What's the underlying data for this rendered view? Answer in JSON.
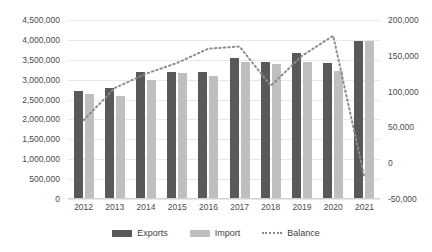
{
  "chart_data": {
    "type": "bar",
    "title": "",
    "subtitle": "",
    "xlabel": "",
    "ylabel": "",
    "y2label": "",
    "grid": true,
    "legend_position": "bottom",
    "categories": [
      "2012",
      "2013",
      "2014",
      "2015",
      "2016",
      "2017",
      "2018",
      "2019",
      "2020",
      "2021"
    ],
    "ylim": [
      0,
      4500000
    ],
    "y2lim": [
      -50000,
      200000
    ],
    "yticks": [
      "0",
      "500,000",
      "1,000,000",
      "1,500,000",
      "2,000,000",
      "2,500,000",
      "3,000,000",
      "3,500,000",
      "4,000,000",
      "4,500,000"
    ],
    "ytick_values": [
      0,
      500000,
      1000000,
      1500000,
      2000000,
      2500000,
      3000000,
      3500000,
      4000000,
      4500000
    ],
    "y2ticks": [
      "-50,000",
      "0",
      "50,000",
      "100,000",
      "150,000",
      "200,000"
    ],
    "y2tick_values": [
      -50000,
      0,
      50000,
      100000,
      150000,
      200000
    ],
    "series": [
      {
        "name": "Exports",
        "type": "bar",
        "axis": "left",
        "color": "#595959",
        "values": [
          2720000,
          2800000,
          3200000,
          3200000,
          3200000,
          3550000,
          3440000,
          3670000,
          3420000,
          3970000
        ]
      },
      {
        "name": "Import",
        "type": "bar",
        "axis": "left",
        "color": "#bfbfbf",
        "values": [
          2640000,
          2590000,
          3000000,
          3170000,
          3100000,
          3440000,
          3400000,
          3440000,
          3220000,
          3970000
        ]
      },
      {
        "name": "Balance",
        "type": "line",
        "style": "dotted",
        "axis": "right",
        "color": "#8c8c8c",
        "values": [
          60000,
          105000,
          125000,
          140000,
          160000,
          163000,
          108000,
          150000,
          178000,
          -20000
        ]
      }
    ]
  },
  "legend": {
    "items": [
      {
        "label": "Exports",
        "swatch": "exports"
      },
      {
        "label": "Import",
        "swatch": "import"
      },
      {
        "label": "Balance",
        "swatch": "balance"
      }
    ]
  },
  "colors": {
    "exports": "#595959",
    "import": "#bfbfbf",
    "balance": "#8c8c8c",
    "grid": "#e8e8e8",
    "text": "#4a4a4a",
    "background": "#ffffff"
  }
}
